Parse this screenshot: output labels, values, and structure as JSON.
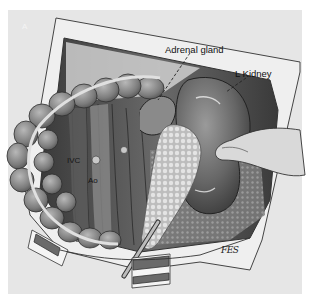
{
  "figure": {
    "panel_letter": "A",
    "labels": {
      "adrenal_gland": "Adrenal gland",
      "left_kidney": "L Kidney",
      "ivc": "IVC",
      "aorta": "Ao"
    },
    "signature": "FES",
    "colors": {
      "background": "#e6e6e6",
      "tissue_dark": "#4a4a4a",
      "tissue_mid": "#7a7a7a",
      "kidney": "#6e6e6e",
      "pancreas": "#cfcfcf",
      "drape": "#f2f2f2"
    }
  }
}
